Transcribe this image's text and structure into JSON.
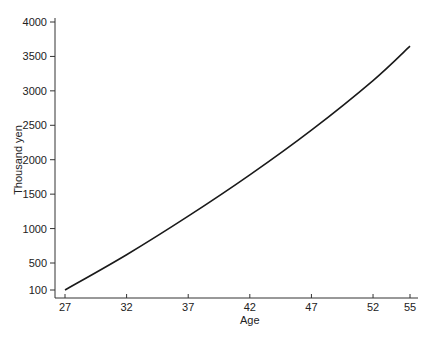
{
  "chart_data": {
    "type": "line",
    "title": "",
    "xlabel": "Age",
    "ylabel": "Thousand yen",
    "x_ticks": [
      27,
      32,
      37,
      42,
      47,
      52,
      55
    ],
    "y_ticks": [
      100,
      500,
      1000,
      1500,
      2000,
      2500,
      3000,
      3500,
      4000
    ],
    "xlim": [
      27,
      55
    ],
    "ylim": [
      100,
      4000
    ],
    "grid": false,
    "legend": null,
    "series": [
      {
        "name": "Thousand yen",
        "x": [
          27,
          32,
          37,
          42,
          47,
          52,
          55
        ],
        "values": [
          100,
          620,
          1180,
          1780,
          2430,
          3150,
          3650
        ]
      }
    ]
  }
}
